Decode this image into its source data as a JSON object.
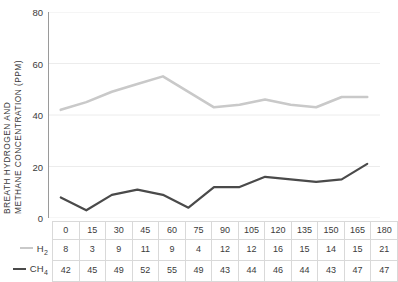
{
  "axis": {
    "y_title_line1": "BREATH HYDROGEN AND",
    "y_title_line2": "METHANE CONCENTRATION (PPM)",
    "y_ticks": [
      "0",
      "20",
      "40",
      "60",
      "80"
    ]
  },
  "legend": {
    "h2_label": "H",
    "h2_sub": "2",
    "ch4_label": "CH",
    "ch4_sub": "4",
    "h2_swatch_color": "#c9c9c9",
    "ch4_swatch_color": "#4a4a4a"
  },
  "chart_data": {
    "type": "line",
    "title": "",
    "xlabel": "",
    "ylabel": "BREATH HYDROGEN AND METHANE CONCENTRATION (PPM)",
    "x": [
      0,
      15,
      30,
      45,
      60,
      75,
      90,
      105,
      120,
      135,
      150,
      165,
      180
    ],
    "categories": [
      "0",
      "15",
      "30",
      "45",
      "60",
      "75",
      "90",
      "105",
      "120",
      "135",
      "150",
      "165",
      "180"
    ],
    "ylim": [
      0,
      80
    ],
    "yticks": [
      0,
      20,
      40,
      60,
      80
    ],
    "grid": true,
    "legend_position": "table-row-headers",
    "series": [
      {
        "name": "H2",
        "values": [
          8,
          3,
          9,
          11,
          9,
          4,
          12,
          12,
          16,
          15,
          14,
          15,
          21
        ],
        "line_color": "#4a4a4a",
        "line_width": 2.2
      },
      {
        "name": "CH4",
        "values": [
          42,
          45,
          49,
          52,
          55,
          49,
          43,
          44,
          46,
          44,
          43,
          47,
          47
        ],
        "line_color": "#c9c9c9",
        "line_width": 2.6
      }
    ]
  },
  "table": {
    "x_values": [
      "0",
      "15",
      "30",
      "45",
      "60",
      "75",
      "90",
      "105",
      "120",
      "135",
      "150",
      "165",
      "180"
    ],
    "h2_values": [
      "8",
      "3",
      "9",
      "11",
      "9",
      "4",
      "12",
      "12",
      "16",
      "15",
      "14",
      "15",
      "21"
    ],
    "ch4_values": [
      "42",
      "45",
      "49",
      "52",
      "55",
      "49",
      "43",
      "44",
      "46",
      "44",
      "43",
      "47",
      "47"
    ]
  },
  "colors": {
    "grid": "#ececec",
    "axis": "#9a9a9a",
    "table_border": "#d9d9d9",
    "text": "#3b3b3b"
  }
}
